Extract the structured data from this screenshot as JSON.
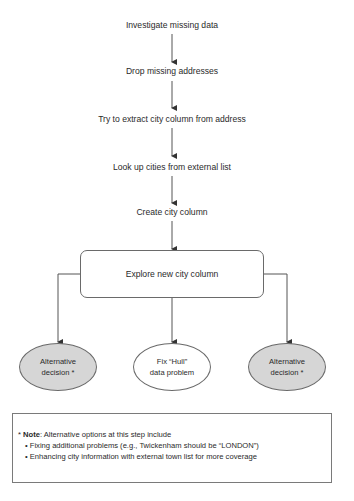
{
  "steps": [
    "Investigate missing data",
    "Drop missing addresses",
    "Try to extract city column from address",
    "Look up cities from external list",
    "Create city column"
  ],
  "decision_box": "Explore new city column",
  "outcomes": {
    "left": {
      "line1": "Alternative",
      "line2": "decision *"
    },
    "center": {
      "line1": "Fix “Hull”",
      "line2": "data problem"
    },
    "right": {
      "line1": "Alternative",
      "line2": "decision *"
    }
  },
  "note": {
    "prefix": "* ",
    "label": "Note",
    "intro": ": Alternative options at this step include",
    "bullets": [
      "Fixing additional problems (e.g., Twickenham should be “LONDON”)",
      "Enhancing city information with external town list for more coverage"
    ]
  },
  "colors": {
    "line": "#555555",
    "alt_fill": "#d6d6d6",
    "main_fill": "#ffffff"
  }
}
